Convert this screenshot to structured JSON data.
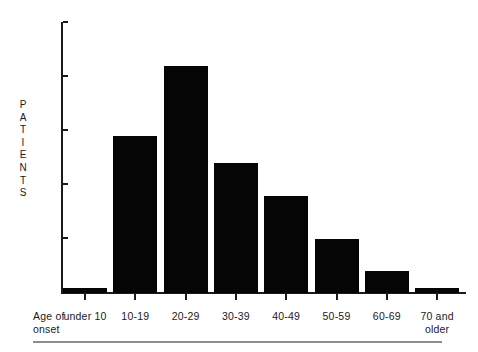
{
  "figure": {
    "axis_color": "#1a1a1a",
    "bar_color": "#050505",
    "rule_color": "#8d8d8d",
    "x_axis_title": "Age of onset",
    "x_axis_title_line1": "Age of",
    "x_axis_title_line2": "onset",
    "y_axis_title": "PATIENTS",
    "y_axis_title_letters": [
      "P",
      "A",
      "T",
      "I",
      "E",
      "N",
      "T",
      "S"
    ]
  },
  "y_ticks": [
    {
      "label": "500",
      "value": 500
    },
    {
      "label": "400",
      "value": 400
    },
    {
      "label": "300",
      "value": 300
    },
    {
      "label": "200",
      "value": 200
    },
    {
      "label": "100",
      "value": 100
    },
    {
      "label": "0",
      "value": 0
    }
  ],
  "x_labels": [
    {
      "line1": "under 10",
      "line2": ""
    },
    {
      "line1": "10-19",
      "line2": ""
    },
    {
      "line1": "20-29",
      "line2": ""
    },
    {
      "line1": "30-39",
      "line2": ""
    },
    {
      "line1": "40-49",
      "line2": ""
    },
    {
      "line1": "50-59",
      "line2": ""
    },
    {
      "line1": "60-69",
      "line2": ""
    },
    {
      "line1": "70 and",
      "line2": "older"
    }
  ],
  "chart_data": {
    "type": "bar",
    "title": "",
    "subtitle": "",
    "xlabel": "Age of onset",
    "ylabel": "PATIENTS",
    "categories": [
      "under 10",
      "10-19",
      "20-29",
      "30-39",
      "40-49",
      "50-59",
      "60-69",
      "70 and older"
    ],
    "values": [
      10,
      290,
      420,
      240,
      180,
      100,
      40,
      10
    ],
    "ylim": [
      0,
      500
    ],
    "ytick_values": [
      0,
      100,
      200,
      300,
      400,
      500
    ],
    "grid": false,
    "legend": false,
    "bar_color": "#050505",
    "orientation": "vertical"
  }
}
